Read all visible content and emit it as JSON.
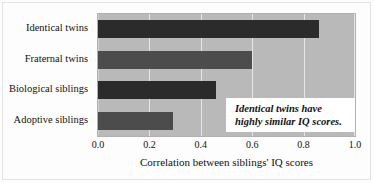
{
  "chart_data": {
    "type": "bar",
    "orientation": "horizontal",
    "title": "",
    "xlabel": "Correlation between siblings' IQ scores",
    "ylabel": "",
    "xlim": [
      0.0,
      1.0
    ],
    "xticks": [
      "0.0",
      "0.2",
      "0.4",
      "0.6",
      "0.8",
      "1.0"
    ],
    "xtick_values": [
      0.0,
      0.2,
      0.4,
      0.6,
      0.8,
      1.0
    ],
    "grid": true,
    "grid_axis": "x",
    "legend": false,
    "categories": [
      "Identical twins",
      "Fraternal twins",
      "Biological siblings",
      "Adoptive siblings"
    ],
    "values": [
      0.86,
      0.6,
      0.46,
      0.29
    ],
    "bar_colors": [
      "#2b2b2b",
      "#4c4c4c",
      "#2b2b2b",
      "#4c4c4c"
    ],
    "plot_background": "#b9b9b9",
    "gridline_color": "#e6e6e6",
    "annotations": [
      {
        "lines": [
          "Identical twins have",
          "highly similar IQ scores."
        ],
        "style": "italic-bold-serif",
        "background": "#ffffff"
      }
    ]
  },
  "axis": {
    "x_title": "Correlation between siblings' IQ scores",
    "ticks": [
      {
        "label": "0.0",
        "value": 0.0
      },
      {
        "label": "0.2",
        "value": 0.2
      },
      {
        "label": "0.4",
        "value": 0.4
      },
      {
        "label": "0.6",
        "value": 0.6
      },
      {
        "label": "0.8",
        "value": 0.8
      },
      {
        "label": "1.0",
        "value": 1.0
      }
    ]
  },
  "bars": [
    {
      "label": "Identical twins",
      "value": 0.86,
      "tone": "dark"
    },
    {
      "label": "Fraternal twins",
      "value": 0.6,
      "tone": "mid"
    },
    {
      "label": "Biological siblings",
      "value": 0.46,
      "tone": "dark"
    },
    {
      "label": "Adoptive siblings",
      "value": 0.29,
      "tone": "mid"
    }
  ],
  "annotation": {
    "line1": "Identical twins have",
    "line2": "highly similar IQ scores."
  }
}
